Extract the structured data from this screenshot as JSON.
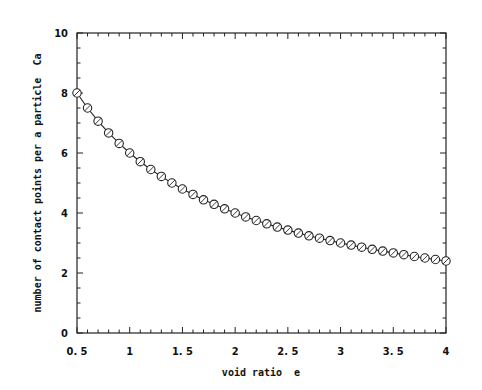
{
  "chart_data": {
    "type": "line",
    "title": "",
    "xlabel": "void ratio  e",
    "ylabel": "number of contact points per a particle  Ca",
    "xlim": [
      0.5,
      4
    ],
    "ylim": [
      0,
      10
    ],
    "x_ticks": [
      0.5,
      1,
      1.5,
      2,
      2.5,
      3,
      3.5,
      4
    ],
    "x_tick_labels": [
      "0. 5",
      "1",
      "1. 5",
      "2",
      "2. 5",
      "3",
      "3. 5",
      "4"
    ],
    "y_ticks": [
      0,
      2,
      4,
      6,
      8,
      10
    ],
    "y_tick_labels": [
      "0",
      "2",
      "4",
      "6",
      "8",
      "10"
    ],
    "x_minor_step": 0.1,
    "y_minor_step": 0.5,
    "grid": false,
    "legend": null,
    "marker": "open-circle",
    "series": [
      {
        "name": "Ca",
        "x": [
          0.5,
          0.6,
          0.7,
          0.8,
          0.9,
          1.0,
          1.1,
          1.2,
          1.3,
          1.4,
          1.5,
          1.6,
          1.7,
          1.8,
          1.9,
          2.0,
          2.1,
          2.2,
          2.3,
          2.4,
          2.5,
          2.6,
          2.7,
          2.8,
          2.9,
          3.0,
          3.1,
          3.2,
          3.3,
          3.4,
          3.5,
          3.6,
          3.7,
          3.8,
          3.9,
          4.0
        ],
        "values": [
          8.0,
          7.5,
          7.06,
          6.67,
          6.32,
          6.0,
          5.71,
          5.45,
          5.22,
          5.0,
          4.8,
          4.62,
          4.44,
          4.29,
          4.14,
          4.0,
          3.87,
          3.75,
          3.64,
          3.53,
          3.43,
          3.33,
          3.24,
          3.16,
          3.08,
          3.0,
          2.93,
          2.86,
          2.79,
          2.73,
          2.67,
          2.61,
          2.55,
          2.5,
          2.45,
          2.4
        ]
      }
    ]
  }
}
